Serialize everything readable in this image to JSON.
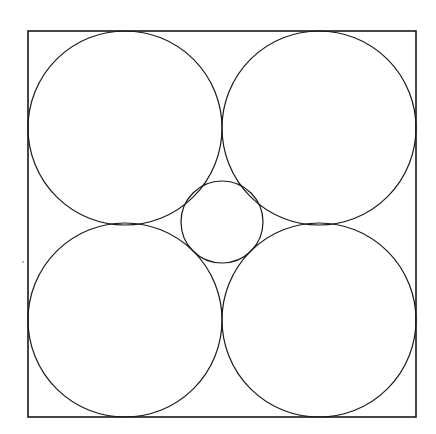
{
  "diagram": {
    "stroke_color": "#1a1a1a",
    "background": "#ffffff",
    "square": {
      "x": 28,
      "y": 31,
      "width": 388,
      "height": 386
    },
    "large_circles": [
      {
        "name": "top-left",
        "cx": 125,
        "cy": 128,
        "r": 97
      },
      {
        "name": "top-right",
        "cx": 319,
        "cy": 128,
        "r": 97
      },
      {
        "name": "bottom-left",
        "cx": 125,
        "cy": 320,
        "r": 97
      },
      {
        "name": "bottom-right",
        "cx": 319,
        "cy": 320,
        "r": 97
      }
    ],
    "center_circle": {
      "cx": 222,
      "cy": 222,
      "r": 41
    },
    "speck": {
      "cx": 23,
      "cy": 262,
      "r": 0.8
    }
  }
}
